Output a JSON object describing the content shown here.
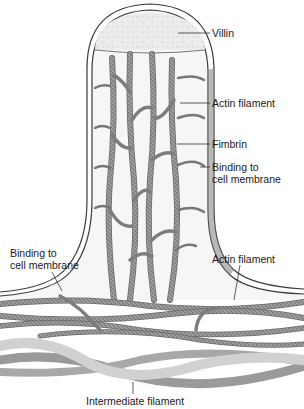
{
  "diagram": {
    "colors": {
      "background": "#ffffff",
      "membrane_outline": "#3a3a3a",
      "membrane_fill": "#f4f4f4",
      "villin_cap": "#e9e9e9",
      "actin": "#8c8c8c",
      "actin_dark": "#5e5e5e",
      "intermediate_light": "#d6d6d6",
      "intermediate_dark": "#9a9a9a",
      "leader_line": "#333333",
      "label_text": "#1a1a1a"
    },
    "labels": {
      "villin": "Villin",
      "actin_filament_top": "Actin filament",
      "fimbrin": "Fimbrin",
      "binding_right": "Binding to\ncell membrane",
      "binding_left": "Binding to\ncell membrane",
      "actin_filament_bottom": "Actin filament",
      "intermediate_filament": "Intermediate filament"
    }
  }
}
